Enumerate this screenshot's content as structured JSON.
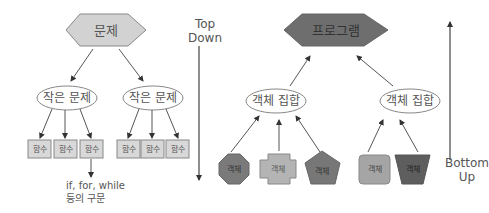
{
  "top_down": {
    "root": {
      "label": "문제",
      "shape": "hexagon",
      "fill": "#d2d2d2"
    },
    "subproblems": [
      {
        "label": "작은 문제",
        "shape": "ellipse",
        "functions": [
          "함수",
          "함수",
          "함수"
        ]
      },
      {
        "label": "작은 문제",
        "shape": "ellipse",
        "functions": [
          "함수",
          "함수",
          "함수"
        ]
      }
    ],
    "note_line1": "if, for, while",
    "note_line2": "등의 구문",
    "direction_line1": "Top",
    "direction_line2": "Down"
  },
  "bottom_up": {
    "root": {
      "label": "프로그램",
      "shape": "hexagon",
      "fill": "#6e6e6e"
    },
    "groups": [
      {
        "label": "객체 집합",
        "shape": "ellipse",
        "objects": [
          {
            "label": "객체",
            "shape": "octagon",
            "fill": "#7a7a7a"
          },
          {
            "label": "객체",
            "shape": "cross",
            "fill": "#b4b4b4"
          },
          {
            "label": "객체",
            "shape": "pentagon",
            "fill": "#777777"
          }
        ]
      },
      {
        "label": "객체 집합",
        "shape": "ellipse",
        "objects": [
          {
            "label": "객체",
            "shape": "rounded-square",
            "fill": "#a5a5a5"
          },
          {
            "label": "객체",
            "shape": "trapezoid",
            "fill": "#5e5e5e"
          }
        ]
      }
    ],
    "direction_line1": "Bottom",
    "direction_line2": "Up"
  },
  "colors": {
    "line": "#555555",
    "text": "#555555",
    "box_fill": "#d8d8d8",
    "ellipse_fill": "#ffffff"
  }
}
